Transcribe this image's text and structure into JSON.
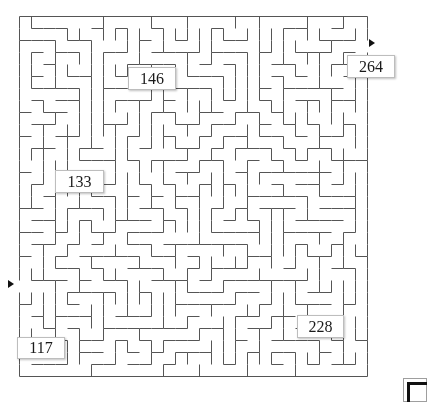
{
  "maze": {
    "left": 19,
    "top": 16,
    "cols": 29,
    "rows": 30,
    "cell": 12,
    "wall_color": "#555555",
    "wall_width": 1,
    "entrance": {
      "side": "left",
      "row": 22
    },
    "exit": {
      "side": "right",
      "row": 2
    }
  },
  "arrows": {
    "entrance": {
      "x": 8,
      "y": 280
    },
    "exit": {
      "x": 369,
      "y": 39
    }
  },
  "labels": [
    {
      "text": "146",
      "x": 128,
      "y": 67,
      "w": 48,
      "h": 23
    },
    {
      "text": "264",
      "x": 347,
      "y": 55,
      "w": 48,
      "h": 23
    },
    {
      "text": "133",
      "x": 55,
      "y": 170,
      "w": 49,
      "h": 23
    },
    {
      "text": "228",
      "x": 297,
      "y": 315,
      "w": 47,
      "h": 23
    },
    {
      "text": "117",
      "x": 17,
      "y": 337,
      "w": 48,
      "h": 22
    }
  ]
}
